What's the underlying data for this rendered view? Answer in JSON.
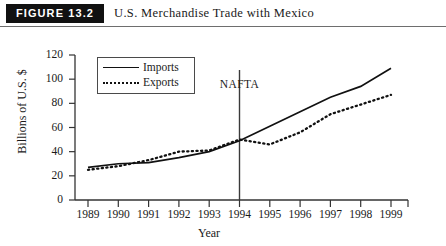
{
  "header": {
    "figure_tag": "FIGURE 13.2",
    "title": "U.S. Merchandise Trade with Mexico"
  },
  "colors": {
    "tag_background": "#111111",
    "tag_text": "#ffffff",
    "ink": "#1a1a1a",
    "line": "#111111",
    "rule": "#6e6e6e"
  },
  "chart_data": {
    "type": "line",
    "title": "U.S. Merchandise Trade with Mexico",
    "xlabel": "Year",
    "ylabel": "Billions of U.S. $",
    "categories": [
      1989,
      1990,
      1991,
      1992,
      1993,
      1994,
      1995,
      1996,
      1997,
      1998,
      1999
    ],
    "xtick_labels": [
      "1989",
      "1990",
      "1991",
      "1992",
      "1993",
      "1994",
      "1995",
      "1996",
      "1997",
      "1998",
      "1999"
    ],
    "ytick_labels": [
      "0",
      "20",
      "40",
      "60",
      "80",
      "100",
      "120"
    ],
    "yticks": [
      0,
      20,
      40,
      60,
      80,
      100,
      120
    ],
    "ylim": [
      0,
      120
    ],
    "xlim": [
      1989,
      1999
    ],
    "grid": false,
    "legend_position": "upper-left-inside",
    "series": [
      {
        "name": "Imports",
        "style": "solid",
        "values": [
          27,
          30,
          31,
          35,
          40,
          49,
          61,
          73,
          85,
          94,
          109
        ]
      },
      {
        "name": "Exports",
        "style": "dotted",
        "values": [
          25,
          28,
          33,
          40,
          41,
          50,
          46,
          56,
          71,
          79,
          87
        ]
      }
    ],
    "annotations": [
      {
        "text": "NAFTA",
        "at_x": 1994,
        "kind": "vertical-line-with-label"
      }
    ]
  }
}
